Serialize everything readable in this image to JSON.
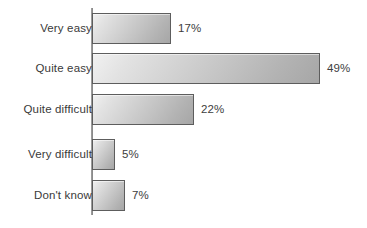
{
  "chart_data": {
    "type": "bar",
    "orientation": "horizontal",
    "title": "",
    "subtitle": "",
    "xlabel": "",
    "ylabel": "",
    "grid": false,
    "legend": false,
    "xlim": [
      0,
      49
    ],
    "axis_line": "vertical-category-axis",
    "categories": [
      "Very easy",
      "Quite easy",
      "Quite difficult",
      "Very difficult",
      "Don't know"
    ],
    "values": [
      17,
      49,
      22,
      5,
      7
    ],
    "value_labels": [
      "17%",
      "49%",
      "22%",
      "5%",
      "7%"
    ],
    "units": "percent",
    "colors": {
      "bar_fill_light": "#f1f1f1",
      "bar_fill_dark": "#a6a6a6",
      "bar_border": "#5d5d5d",
      "axis": "#8a8a8a",
      "text": "#3a3a3a",
      "background": "#ffffff"
    }
  },
  "rows": [
    {
      "label": "Very easy",
      "value": 17,
      "value_label": "17%"
    },
    {
      "label": "Quite easy",
      "value": 49,
      "value_label": "49%"
    },
    {
      "label": "Quite difficult",
      "value": 22,
      "value_label": "22%"
    },
    {
      "label": "Very difficult",
      "value": 5,
      "value_label": "5%"
    },
    {
      "label": "Don't know",
      "value": 7,
      "value_label": "7%"
    }
  ]
}
